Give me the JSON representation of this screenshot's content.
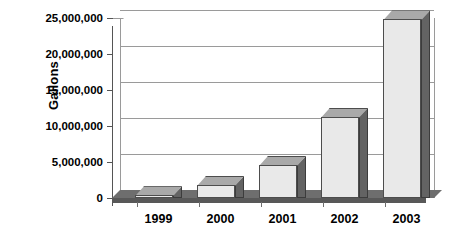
{
  "chart_data": {
    "type": "bar",
    "title": "",
    "subtitle": "",
    "xlabel": "",
    "ylabel": "Gallons",
    "categories": [
      "1999",
      "2000",
      "2001",
      "2002",
      "2003"
    ],
    "values": [
      400000,
      1800000,
      4600000,
      11300000,
      24800000
    ],
    "series": [
      {
        "name": "Gallons",
        "values": [
          400000,
          1800000,
          4600000,
          11300000,
          24800000
        ]
      }
    ],
    "ylim": [
      0,
      25000000
    ],
    "ytick_values": [
      0,
      5000000,
      10000000,
      15000000,
      20000000,
      25000000
    ],
    "ytick_labels": [
      "0",
      "5,000,000",
      "10,000,000",
      "15,000,000",
      "20,000,000",
      "25,000,000"
    ],
    "grid": true,
    "grid_axis": "y",
    "legend": false,
    "legend_position": "none",
    "style": "3d-column",
    "colors": {
      "bar_front": "#e9e9e9",
      "bar_top": "#a9a9a9",
      "bar_side": "#636363",
      "bar_outline": "#4d4d4d",
      "gridline": "#9a9a9a",
      "axis": "#555555",
      "floor": "#6e6e6e",
      "background": "#ffffff",
      "text": "#000000"
    }
  }
}
